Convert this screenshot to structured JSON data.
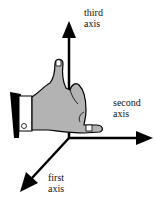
{
  "diagram": {
    "type": "right-hand-rule-3d-axes",
    "labels": {
      "third_axis": [
        "third",
        "axis"
      ],
      "second_axis": [
        "second",
        "axis"
      ],
      "first_axis": [
        "first",
        "axis"
      ]
    },
    "colors": {
      "axis": "#000000",
      "hand_fill": "#b3b3b3",
      "hand_outline": "#000000",
      "cuff": "#ffffff",
      "sleeve": "#000000",
      "background": "#ffffff"
    }
  }
}
